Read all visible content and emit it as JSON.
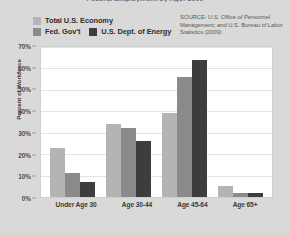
{
  "chart_data": {
    "type": "bar",
    "title": "Federal Employment by Age: 2009",
    "xlabel": "",
    "ylabel": "Percent of Workforce",
    "categories": [
      "Under Age 30",
      "Age 30-44",
      "Age 45-64",
      "Age 65+"
    ],
    "series": [
      {
        "name": "Total U.S. Economy",
        "color": "#b4b4b4",
        "values": [
          23,
          34,
          39,
          5
        ]
      },
      {
        "name": "Fed. Gov't",
        "color": "#8a8a8a",
        "values": [
          11,
          32,
          56,
          2
        ]
      },
      {
        "name": "U.S. Dept. of Energy",
        "color": "#3d3d3d",
        "values": [
          7,
          26,
          64,
          2
        ]
      }
    ],
    "ylim": [
      0,
      70
    ],
    "yticks": [
      "70%",
      "60%",
      "50%",
      "40%",
      "30%",
      "20%",
      "10%",
      "0%"
    ],
    "ytick_values": [
      70,
      60,
      50,
      40,
      30,
      20,
      10,
      0
    ],
    "grid": true,
    "legend_position": "top-left",
    "value_suffix": "%"
  },
  "source": {
    "text": "SOURCE: U.S. Office of Personnel Management; and U.S. Bureau of Labor Statistics (2009)"
  }
}
